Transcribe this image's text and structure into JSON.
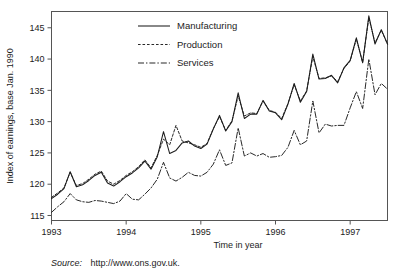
{
  "chart_data": {
    "type": "line",
    "title": "",
    "xlabel": "Time in year",
    "ylabel": "Index of earnings, base Jan. 1990",
    "xlim": [
      1993.0,
      1997.5
    ],
    "ylim": [
      114.2,
      147.6
    ],
    "xticks": [
      "1993",
      "1994",
      "1995",
      "1996",
      "1997"
    ],
    "xtick_values": [
      1993,
      1994,
      1995,
      1996,
      1997
    ],
    "yticks": [
      "115",
      "120",
      "125",
      "130",
      "135",
      "140",
      "145"
    ],
    "ytick_values": [
      115,
      120,
      125,
      130,
      135,
      140,
      145
    ],
    "grid": false,
    "legend_position": "top-center",
    "x": [
      1993.0,
      1993.083,
      1993.167,
      1993.25,
      1993.333,
      1993.417,
      1993.5,
      1993.583,
      1993.667,
      1993.75,
      1993.833,
      1993.917,
      1994.0,
      1994.083,
      1994.167,
      1994.25,
      1994.333,
      1994.417,
      1994.5,
      1994.583,
      1994.667,
      1994.75,
      1994.833,
      1994.917,
      1995.0,
      1995.083,
      1995.167,
      1995.25,
      1995.333,
      1995.417,
      1995.5,
      1995.583,
      1995.667,
      1995.75,
      1995.833,
      1995.917,
      1996.0,
      1996.083,
      1996.167,
      1996.25,
      1996.333,
      1996.417,
      1996.5,
      1996.583,
      1996.667,
      1996.75,
      1996.833,
      1996.917,
      1997.0,
      1997.083,
      1997.167,
      1997.25,
      1997.333,
      1997.417,
      1997.5
    ],
    "series": [
      {
        "name": "Manufacturing",
        "style": "solid",
        "color": "#1c1c1c",
        "values": [
          117.7,
          118.4,
          119.3,
          122.0,
          119.6,
          119.9,
          120.6,
          121.4,
          121.9,
          120.2,
          119.7,
          120.4,
          121.2,
          121.8,
          122.6,
          123.7,
          122.4,
          124.4,
          128.4,
          124.9,
          125.4,
          126.6,
          126.9,
          126.1,
          125.7,
          126.4,
          128.8,
          131.0,
          128.5,
          130.0,
          134.6,
          130.5,
          131.2,
          131.2,
          133.4,
          131.7,
          131.4,
          130.3,
          132.8,
          136.1,
          133.1,
          134.8,
          140.8,
          136.8,
          136.9,
          137.4,
          136.2,
          138.6,
          139.8,
          143.4,
          139.4,
          146.9,
          142.4,
          144.7,
          142.4
        ]
      },
      {
        "name": "Production",
        "style": "dashed",
        "color": "#1c1c1c",
        "values": [
          117.9,
          118.6,
          119.4,
          121.9,
          119.8,
          120.1,
          120.8,
          121.6,
          122.1,
          120.5,
          120.0,
          120.6,
          121.4,
          122.0,
          122.8,
          123.9,
          122.6,
          124.6,
          127.2,
          126.3,
          129.4,
          126.9,
          126.6,
          126.3,
          125.9,
          126.5,
          128.9,
          130.8,
          128.6,
          130.1,
          134.1,
          130.9,
          131.4,
          131.3,
          133.3,
          131.8,
          131.5,
          130.5,
          132.9,
          135.9,
          133.3,
          134.9,
          140.4,
          136.9,
          137.0,
          137.3,
          136.4,
          138.5,
          139.7,
          143.2,
          139.5,
          146.6,
          142.6,
          144.6,
          142.4
        ]
      },
      {
        "name": "Services",
        "style": "dashdot",
        "color": "#1c1c1c",
        "values": [
          115.5,
          116.4,
          117.2,
          118.5,
          117.5,
          117.2,
          117.1,
          117.4,
          117.3,
          117.1,
          116.9,
          117.3,
          118.5,
          117.6,
          117.5,
          118.4,
          119.4,
          120.8,
          123.5,
          121.0,
          120.5,
          121.1,
          121.9,
          121.4,
          121.3,
          121.9,
          123.2,
          125.5,
          123.0,
          123.4,
          129.0,
          124.5,
          125.0,
          124.5,
          124.9,
          124.3,
          124.4,
          124.6,
          125.9,
          128.6,
          126.3,
          126.9,
          133.3,
          128.2,
          129.6,
          129.3,
          129.4,
          129.4,
          132.2,
          134.8,
          132.1,
          140.0,
          134.3,
          136.1,
          135.2
        ]
      }
    ]
  },
  "source": {
    "prefix": "Source:",
    "url": "http://www.ons.gov.uk."
  },
  "legend": {
    "items": [
      {
        "label": "Manufacturing"
      },
      {
        "label": "Production"
      },
      {
        "label": "Services"
      }
    ]
  },
  "colors": {
    "ink": "#1c1c1c",
    "frame": "#555555",
    "background": "#ffffff"
  }
}
